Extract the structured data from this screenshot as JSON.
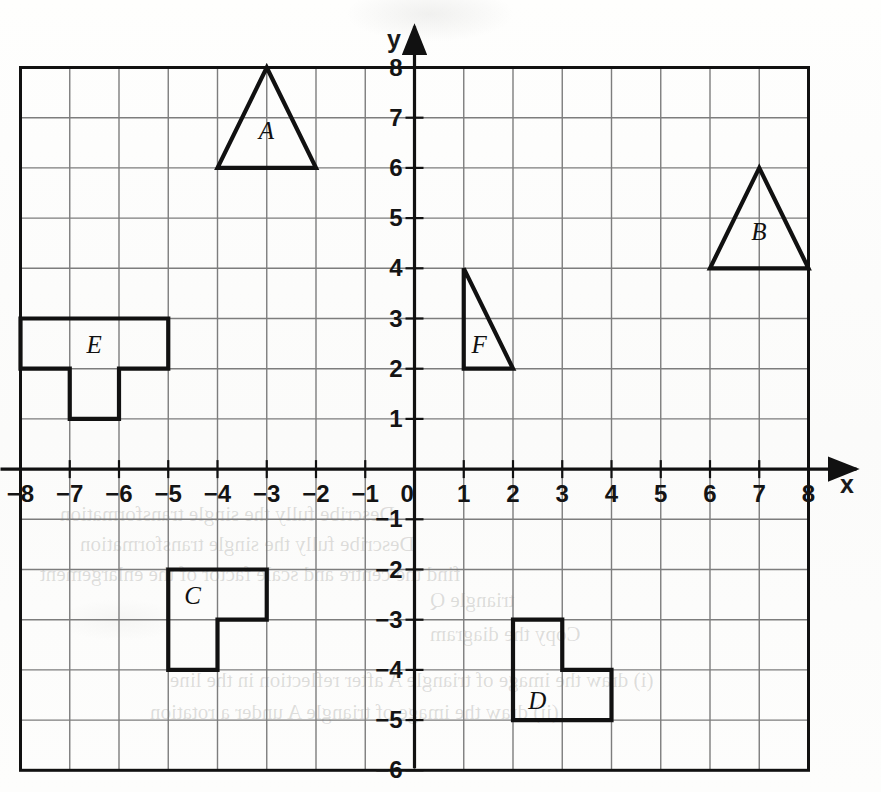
{
  "figure": {
    "kind": "cartesian-grid-shapes",
    "background_color": "#fdfdfc",
    "grid_line_color": "#7d7d7d",
    "axis_color": "#111111",
    "shape_stroke_color": "#111111"
  },
  "axes": {
    "x_axis_label": "x",
    "y_axis_label": "y",
    "origin_label": "0",
    "x_min": -8,
    "x_max": 8,
    "y_min": -6,
    "y_max": 8,
    "x_tick_labels": [
      "-8",
      "-7",
      "-6",
      "-5",
      "-4",
      "-3",
      "-2",
      "-1",
      "0",
      "1",
      "2",
      "3",
      "4",
      "5",
      "6",
      "7",
      "8"
    ],
    "y_tick_labels_positive": [
      "1",
      "2",
      "3",
      "4",
      "5",
      "6",
      "7",
      "8"
    ],
    "y_tick_labels_negative": [
      "-1",
      "-2",
      "-3",
      "-4",
      "-5",
      "-6"
    ],
    "gridlines": true,
    "arrow_on_x_axis": true,
    "arrow_on_y_axis": true
  },
  "shapes": [
    {
      "id": "A",
      "label": "A",
      "type": "triangle",
      "description": "isosceles triangle, apex up",
      "points": [
        [
          -3,
          8
        ],
        [
          -2,
          6
        ],
        [
          -4,
          6
        ]
      ],
      "label_position": [
        -3,
        6.75
      ]
    },
    {
      "id": "B",
      "label": "B",
      "type": "triangle",
      "description": "isosceles triangle, apex up",
      "points": [
        [
          7,
          6
        ],
        [
          8,
          4
        ],
        [
          6,
          4
        ]
      ],
      "label_position": [
        7,
        4.75
      ]
    },
    {
      "id": "C",
      "label": "C",
      "type": "polygon",
      "description": "L-shaped hexomino-style block",
      "points": [
        [
          -5,
          -2
        ],
        [
          -3,
          -2
        ],
        [
          -3,
          -3
        ],
        [
          -4,
          -3
        ],
        [
          -4,
          -4
        ],
        [
          -5,
          -4
        ]
      ],
      "label_position": [
        -4.5,
        -2.5
      ]
    },
    {
      "id": "D",
      "label": "D",
      "type": "polygon",
      "description": "L-shaped block",
      "points": [
        [
          2,
          -3
        ],
        [
          3,
          -3
        ],
        [
          3,
          -4
        ],
        [
          4,
          -4
        ],
        [
          4,
          -5
        ],
        [
          2,
          -5
        ]
      ],
      "label_position": [
        2.5,
        -4.6
      ]
    },
    {
      "id": "E",
      "label": "E",
      "type": "polygon",
      "description": "T-shaped block pointing down",
      "points": [
        [
          -8,
          3
        ],
        [
          -5,
          3
        ],
        [
          -5,
          2
        ],
        [
          -6,
          2
        ],
        [
          -6,
          1
        ],
        [
          -7,
          1
        ],
        [
          -7,
          2
        ],
        [
          -8,
          2
        ]
      ],
      "label_position": [
        -6.5,
        2.5
      ]
    },
    {
      "id": "F",
      "label": "F",
      "type": "triangle",
      "description": "right-angled triangle, right angle at bottom-left",
      "points": [
        [
          1,
          4
        ],
        [
          2,
          2
        ],
        [
          1,
          2
        ]
      ],
      "label_position": [
        1.32,
        2.5
      ]
    }
  ],
  "bleed_text": [
    "Describe fully the single transformation",
    "Describe fully the single transformation",
    "find the centre and scale factor of the enlargement",
    "triangle Q",
    "Copy the diagram",
    "(i) draw the image of triangle A after reflection in the line",
    "(ii) draw the image of triangle A under a rotation"
  ]
}
